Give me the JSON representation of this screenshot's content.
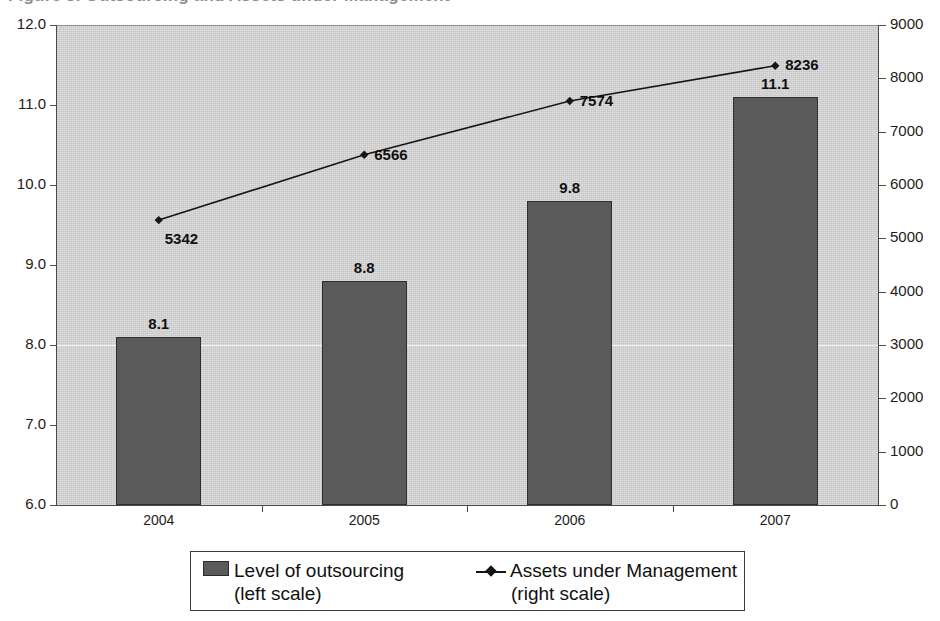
{
  "title_remnant": "Figure 3. Outsourcing and Assets under Management",
  "chart_data": {
    "type": "bar",
    "title": "",
    "subtitle": "",
    "xlabel": "",
    "categories": [
      "2004",
      "2005",
      "2006",
      "2007"
    ],
    "grid": "single faint horizontal gridline at left 8.0 / right 3000",
    "legend_position": "bottom",
    "axes": {
      "left": {
        "label": "Level of outsourcing (left scale)",
        "ylim": [
          6.0,
          12.0
        ],
        "ticks": [
          "6.0",
          "7.0",
          "8.0",
          "9.0",
          "10.0",
          "11.0",
          "12.0"
        ],
        "tick_values": [
          6.0,
          7.0,
          8.0,
          9.0,
          10.0,
          11.0,
          12.0
        ]
      },
      "right": {
        "label": "Assets under Management (right scale)",
        "ylim": [
          0,
          9000
        ],
        "ticks": [
          "0",
          "1000",
          "2000",
          "3000",
          "4000",
          "5000",
          "6000",
          "7000",
          "8000",
          "9000"
        ],
        "tick_values": [
          0,
          1000,
          2000,
          3000,
          4000,
          5000,
          6000,
          7000,
          8000,
          9000
        ]
      }
    },
    "series": [
      {
        "name": "Level of outsourcing",
        "scale": "left",
        "render": "bar",
        "color": "#5a5a5a",
        "values": [
          8.1,
          8.8,
          9.8,
          11.1
        ],
        "labels": [
          "8.1",
          "8.8",
          "9.8",
          "11.1"
        ]
      },
      {
        "name": "Assets under Management",
        "scale": "right",
        "render": "line",
        "color": "#161616",
        "marker": "diamond",
        "values": [
          5342,
          6566,
          7574,
          8236
        ],
        "labels": [
          "5342",
          "6566",
          "7574",
          "8236"
        ]
      }
    ]
  },
  "legend": {
    "items": [
      {
        "marker": "box",
        "line1": "Level of outsourcing",
        "line2": "(left scale)"
      },
      {
        "marker": "line",
        "line1": "Assets under Management",
        "line2": "(right scale)"
      }
    ]
  }
}
